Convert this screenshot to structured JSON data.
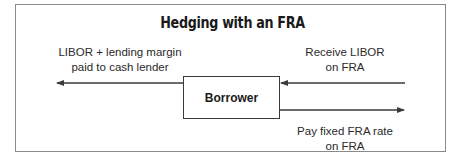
{
  "title": "Hedging with an FRA",
  "center_node": "Borrower",
  "flows": {
    "left_out": {
      "line1": "LIBOR + lending margin",
      "line2": "paid to cash lender"
    },
    "right_in": {
      "line1": "Receive LIBOR",
      "line2": "on FRA"
    },
    "right_out": {
      "line1": "Pay fixed FRA rate",
      "line2": "on FRA"
    }
  },
  "colors": {
    "line": "#3a3a3a",
    "frame": "#8a8a8a"
  }
}
